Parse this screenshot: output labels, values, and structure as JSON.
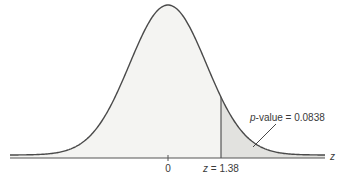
{
  "chart_data": {
    "type": "area",
    "title": "",
    "distribution": "standard normal",
    "xlabel": "z",
    "ylabel": "",
    "mean": 0,
    "tick_labels": [
      "0"
    ],
    "critical_value": {
      "variable": "z",
      "value": 1.38,
      "label": "z = 1.38"
    },
    "shaded_region": {
      "from": 1.38,
      "to": "infinity",
      "tail": "right"
    },
    "annotation": {
      "prefix": "p",
      "text": "-value = 0.0838",
      "value": 0.0838
    },
    "colors": {
      "curve": "#4a4a4a",
      "fill": "#f4f4f2",
      "tail_fill": "#e2e2df",
      "axis": "#555555"
    }
  },
  "labels": {
    "axis_var": "z",
    "zero": "0",
    "z_prefix": "z",
    "z_value": " = 1.38",
    "p_prefix": "p",
    "p_text": "-value = 0.0838"
  }
}
